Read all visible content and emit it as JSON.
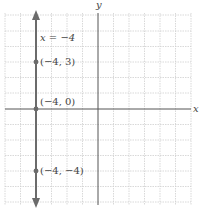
{
  "graph": {
    "x_axis_label": "x",
    "y_axis_label": "y",
    "line_label": "x = −4",
    "points": [
      {
        "label": "(−4, 3)",
        "x": -4,
        "y": 3
      },
      {
        "label": "(−4, 0)",
        "x": -4,
        "y": 0
      },
      {
        "label": "(−4, −4)",
        "x": -4,
        "y": -4
      }
    ],
    "x_range": [
      -6,
      6
    ],
    "y_range": [
      -6,
      6
    ],
    "grid": true,
    "colors": {
      "line": "#6b6b6b",
      "axis": "#555555",
      "grid": "#c8c8c8"
    }
  }
}
